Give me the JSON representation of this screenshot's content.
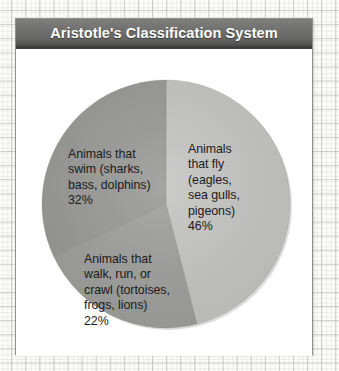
{
  "background": {
    "name": "graph-paper",
    "grid_color": "#c9c9c7",
    "page_color": "#fcfcfb"
  },
  "card": {
    "title": "Aristotle's Classification System",
    "title_bar_color": "#6f6f6d",
    "title_text_color": "#ffffff",
    "body_color": "#ffffff",
    "border_color": "#8e8e8c"
  },
  "chart_data": {
    "type": "pie",
    "title": "Aristotle's Classification System",
    "xlabel": "",
    "ylabel": "",
    "legend": "none",
    "labels_inside": true,
    "categories": [
      "Animals that fly (eagles, sea gulls, pigeons)",
      "Animals that swim (sharks, bass, dolphins)",
      "Animals that walk, run, or crawl (tortoises, frogs, lions)"
    ],
    "values": [
      46,
      22,
      32
    ],
    "unit": "%",
    "slices": [
      {
        "name": "fly",
        "label": "Animals\nthat fly\n(eagles,\nsea gulls,\npigeons)\n46%",
        "text": "Animals that fly (eagles, sea gulls, pigeons)",
        "percent": 46,
        "percent_text": "46%",
        "color": "#c6c6c4",
        "start_deg": 0,
        "end_deg": 165.6
      },
      {
        "name": "walk-run-crawl",
        "label": "Animals that\nwalk, run, or\ncrawl (tortoises,\nfrogs, lions)\n22%",
        "text": "Animals that walk, run, or crawl (tortoises, frogs, lions)",
        "percent": 22,
        "percent_text": "22%",
        "color": "#a0a09e",
        "start_deg": 165.6,
        "end_deg": 244.8
      },
      {
        "name": "swim",
        "label": "Animals that\nswim (sharks,\nbass, dolphins)\n32%",
        "text": "Animals that swim (sharks, bass, dolphins)",
        "percent": 32,
        "percent_text": "32%",
        "color": "#9a9a98",
        "start_deg": 244.8,
        "end_deg": 360
      }
    ]
  }
}
